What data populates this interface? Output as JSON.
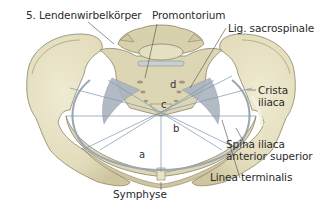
{
  "figure": {
    "colors": {
      "bone": "#e6e1c3",
      "bone_shadow": "#cfc7a2",
      "bone_outline": "#8c8466",
      "ligament": "#9aa6b2",
      "measure_line": "#7d95b0",
      "leader_line": "#4a4a4a",
      "text": "#2a2a2a"
    }
  },
  "labels": {
    "lumbar_vertebra": "5. Lendenwirbelkörper",
    "promontorium": "Promontorium",
    "lig_sacrospinale": "Lig. sacrospinale",
    "crista_iliaca_1": "Crista",
    "crista_iliaca_2": "iliaca",
    "spina_1": "Spina iliaca",
    "spina_2": "anterior superior",
    "linea_terminalis": "Linea terminalis",
    "symphyse": "Symphyse"
  },
  "measurements": {
    "a": "a",
    "b": "b",
    "c": "c",
    "d": "d"
  }
}
